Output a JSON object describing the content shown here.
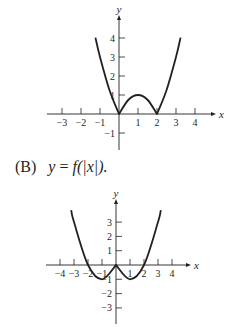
{
  "caption": {
    "label": "(B)",
    "equation_prefix": "y",
    "equation_eq": " = ",
    "equation_body": "f(|x|)."
  },
  "chart_data": [
    {
      "type": "line",
      "title": "",
      "xlabel": "x",
      "ylabel": "y",
      "function": "y = |x^2 - 2x|",
      "x_ticks": [
        -3,
        -2,
        -1,
        1,
        2,
        3,
        4
      ],
      "y_ticks": [
        -1,
        1,
        2,
        3,
        4
      ],
      "xlim": [
        -4,
        5
      ],
      "ylim": [
        -2,
        4.5
      ],
      "grid": false,
      "x": [
        -1.24,
        -1,
        -0.5,
        0,
        0.5,
        1,
        1.5,
        2,
        2.5,
        3,
        3.24
      ],
      "values": [
        4.02,
        3,
        1.25,
        0,
        0.75,
        1,
        0.75,
        0,
        1.25,
        3,
        4.02
      ]
    },
    {
      "type": "line",
      "title": "",
      "xlabel": "x",
      "ylabel": "y",
      "function": "y = f(|x|), f(x) = x^2 - 2x",
      "x_ticks": [
        -4,
        -3,
        -2,
        -1,
        1,
        2,
        3,
        4
      ],
      "y_ticks": [
        -3,
        -2,
        -1,
        1,
        2,
        3
      ],
      "xlim": [
        -5,
        5.5
      ],
      "ylim": [
        -4.2,
        4.5
      ],
      "grid": false,
      "x": [
        -3.2,
        -3,
        -2,
        -1,
        0,
        1,
        2,
        3,
        3.2
      ],
      "values": [
        3.84,
        3,
        0,
        -1,
        0,
        -1,
        0,
        3,
        3.84
      ]
    }
  ]
}
